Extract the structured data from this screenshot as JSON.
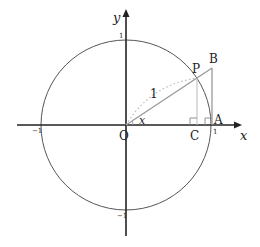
{
  "diagram": {
    "type": "unit-circle-trigonometry",
    "axes": {
      "x_label": "x",
      "y_label": "y",
      "ticks": {
        "x_neg": "−1",
        "x_pos": "1",
        "y_pos": "1",
        "y_neg": "−1"
      }
    },
    "points": {
      "O": "O",
      "A": "A",
      "B": "B",
      "C": "C",
      "P": "P"
    },
    "labels": {
      "radius": "1",
      "angle": "x"
    },
    "colors": {
      "axis": "#222222",
      "circle": "#555555",
      "segments": "#999999",
      "dotted_arc": "#bbbbbb"
    }
  }
}
